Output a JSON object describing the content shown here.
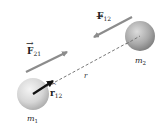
{
  "diagram": {
    "masses": [
      {
        "id": "m1",
        "label": "m",
        "subscript": "1",
        "cx": 33,
        "cy": 94,
        "r": 16
      },
      {
        "id": "m2",
        "label": "m",
        "subscript": "2",
        "cx": 140,
        "cy": 36,
        "r": 15
      }
    ],
    "forces": [
      {
        "id": "F12",
        "label": "F",
        "subscript": "12",
        "from": [
          132,
          17
        ],
        "to": [
          94,
          37
        ],
        "color": "#8c8c8c"
      },
      {
        "id": "F21",
        "label": "F",
        "subscript": "21",
        "from": [
          26,
          72
        ],
        "to": [
          67,
          52
        ],
        "color": "#8c8c8c"
      }
    ],
    "unit_vector": {
      "label": "r",
      "subscript": "12",
      "hat": "^",
      "from": [
        33,
        94
      ],
      "to": [
        53,
        81
      ],
      "color": "#111111"
    },
    "distance": {
      "label": "r",
      "from": [
        33,
        94
      ],
      "to": [
        140,
        36
      ],
      "style": "dashed",
      "color": "#555555"
    },
    "colors": {
      "background": "#ffffff",
      "sphere_light": "#eeeeee",
      "sphere_dark": "#a8a8a8",
      "force_arrow": "#8c8c8c",
      "unit_arrow": "#111111"
    }
  }
}
